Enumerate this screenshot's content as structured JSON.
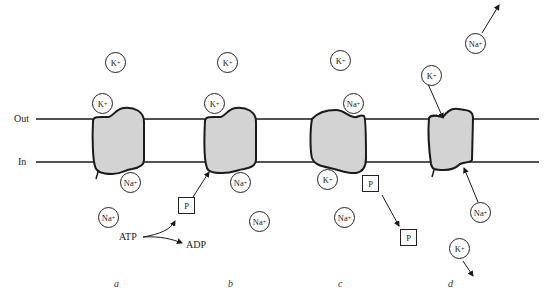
{
  "membrane": {
    "out_label": "Out",
    "in_label": "In"
  },
  "panels": [
    {
      "label": "a"
    },
    {
      "label": "b"
    },
    {
      "label": "c"
    },
    {
      "label": "d"
    }
  ],
  "ions": {
    "k": "K",
    "na": "Na",
    "charge": "+"
  },
  "phosphate": "P",
  "atp": "ATP",
  "adp": "ADP",
  "colors": {
    "protein_fill": "#d3d3d3",
    "stroke": "#1a1a1a",
    "background": "#ffffff"
  }
}
